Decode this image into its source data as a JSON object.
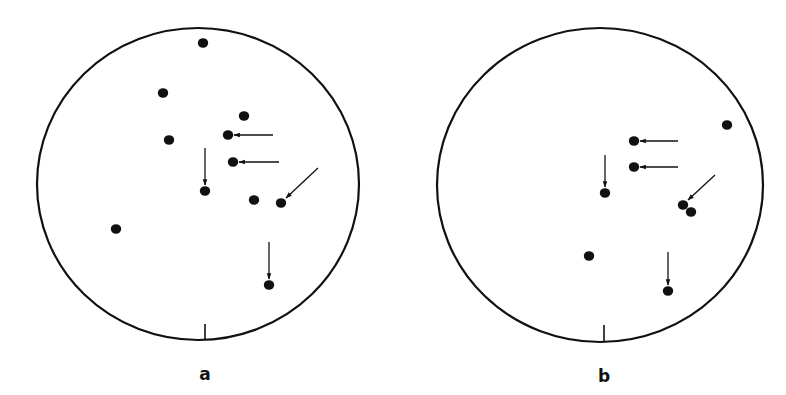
{
  "figure": {
    "colors": {
      "ink": "#111111",
      "background": "#ffffff"
    },
    "panels": [
      {
        "label": "a",
        "circle": {
          "cx": 198,
          "cy": 184,
          "rx": 161,
          "ry": 156
        },
        "tick": {
          "x": 205,
          "y1": 324,
          "y2": 340
        },
        "label_pos": {
          "x": 205,
          "y": 366
        },
        "points": [
          {
            "x": 203,
            "y": 43
          },
          {
            "x": 163,
            "y": 93
          },
          {
            "x": 244,
            "y": 116
          },
          {
            "x": 228,
            "y": 135,
            "arrow": {
              "x1": 273,
              "y1": 135,
              "x2": 234,
              "y2": 135
            }
          },
          {
            "x": 169,
            "y": 140
          },
          {
            "x": 233,
            "y": 162,
            "arrow": {
              "x1": 279,
              "y1": 162,
              "x2": 239,
              "y2": 162
            }
          },
          {
            "x": 205,
            "y": 191,
            "arrow": {
              "x1": 205,
              "y1": 148,
              "x2": 205,
              "y2": 185
            }
          },
          {
            "x": 254,
            "y": 200
          },
          {
            "x": 281,
            "y": 203,
            "arrow": {
              "x1": 318,
              "y1": 168,
              "x2": 286,
              "y2": 198
            }
          },
          {
            "x": 116,
            "y": 229
          },
          {
            "x": 269,
            "y": 285,
            "arrow": {
              "x1": 269,
              "y1": 242,
              "x2": 269,
              "y2": 279
            }
          }
        ]
      },
      {
        "label": "b",
        "circle": {
          "cx": 600,
          "cy": 185,
          "rx": 163,
          "ry": 157
        },
        "tick": {
          "x": 604,
          "y1": 325,
          "y2": 342
        },
        "label_pos": {
          "x": 604,
          "y": 368
        },
        "points": [
          {
            "x": 727,
            "y": 125
          },
          {
            "x": 634,
            "y": 141,
            "arrow": {
              "x1": 678,
              "y1": 141,
              "x2": 640,
              "y2": 141
            }
          },
          {
            "x": 634,
            "y": 167,
            "arrow": {
              "x1": 678,
              "y1": 167,
              "x2": 640,
              "y2": 167
            }
          },
          {
            "x": 605,
            "y": 193,
            "arrow": {
              "x1": 605,
              "y1": 155,
              "x2": 605,
              "y2": 187
            }
          },
          {
            "x": 683,
            "y": 205,
            "arrow": {
              "x1": 715,
              "y1": 175,
              "x2": 688,
              "y2": 200
            }
          },
          {
            "x": 691,
            "y": 212
          },
          {
            "x": 589,
            "y": 256
          },
          {
            "x": 668,
            "y": 291,
            "arrow": {
              "x1": 668,
              "y1": 252,
              "x2": 668,
              "y2": 285
            }
          }
        ]
      }
    ]
  }
}
